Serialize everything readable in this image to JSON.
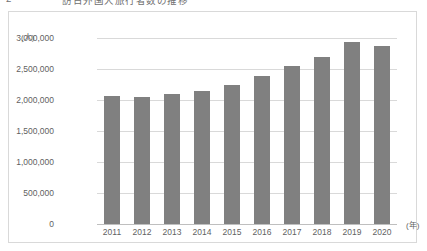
{
  "document": {
    "clipped_heading_number": "2",
    "clipped_heading_text": "訪日外国人旅行者数の推移"
  },
  "chart": {
    "y_unit_label": "(人)",
    "x_unit_label": "(年)"
  },
  "chart_data": {
    "type": "bar",
    "title": "",
    "xlabel": "(年)",
    "ylabel": "(人)",
    "categories": [
      "2011",
      "2012",
      "2013",
      "2014",
      "2015",
      "2016",
      "2017",
      "2018",
      "2019",
      "2020"
    ],
    "values": [
      2070000,
      2050000,
      2100000,
      2140000,
      2240000,
      2380000,
      2550000,
      2700000,
      2930000,
      2870000
    ],
    "ylim": [
      0,
      3000000
    ],
    "ytick_values": [
      0,
      500000,
      1000000,
      1500000,
      2000000,
      2500000,
      3000000
    ],
    "ytick_labels": [
      "0",
      "500,000",
      "1,000,000",
      "1,500,000",
      "2,000,000",
      "2,500,000",
      "3,000,000"
    ],
    "grid": true,
    "legend": "none",
    "series_color": "#808080",
    "grid_color": "#d9d9d9",
    "border_color": "#d9d9d9"
  }
}
